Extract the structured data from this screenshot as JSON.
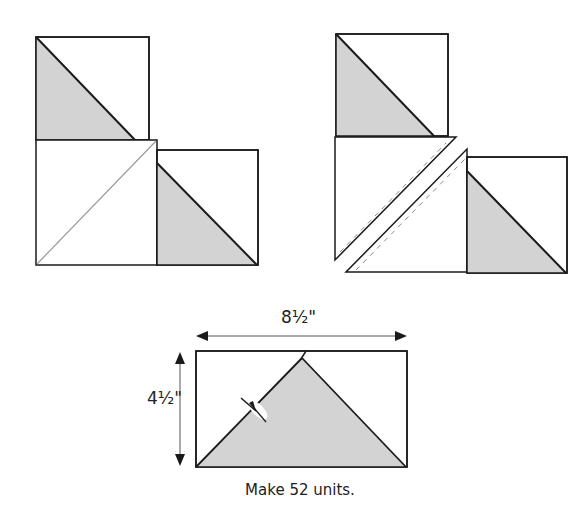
{
  "diagram": {
    "kind": "quilt half-square-triangle assembly instructions",
    "colors": {
      "fabric_gray": "#d3d3d3",
      "fabric_white": "#ffffff",
      "outline": "#1a1a1a",
      "seam_line": "#9a9a9a",
      "stitch_dash": "#8a8a8a"
    },
    "steps": [
      {
        "id": "step-1-layout",
        "description": "Two gray/white half-square-triangle squares placed at corners of a larger white square with a diagonal guide line"
      },
      {
        "id": "step-2-sew-and-cut",
        "description": "Large square cut along diagonal with stitch lines (dashed) on either side of the cut"
      },
      {
        "id": "step-3-result",
        "description": "Finished flying-geese style unit with gray triangle, pressed seam shown with pin/iron mark"
      }
    ],
    "dimensions": {
      "width_label": "8½\"",
      "height_label": "4½\""
    },
    "caption": "Make 52 units."
  }
}
